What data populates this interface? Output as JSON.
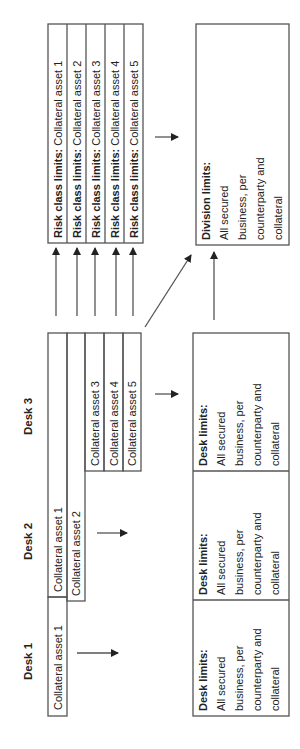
{
  "desks": [
    {
      "label": "Desk 1",
      "collateral": [
        "Collateral asset 1"
      ]
    },
    {
      "label": "Desk 2",
      "collateral": [
        "Collateral asset 1",
        "Collateral asset 2"
      ]
    },
    {
      "label": "Desk 3",
      "collateral": [
        "Collateral asset 3",
        "Collateral asset 4",
        "Collateral asset 5"
      ]
    }
  ],
  "risk_class_limits": [
    {
      "title": "Risk class limits:",
      "asset": "Collateral asset 1"
    },
    {
      "title": "Risk class limits:",
      "asset": "Collateral asset 2"
    },
    {
      "title": "Risk class limits:",
      "asset": "Collateral asset 3"
    },
    {
      "title": "Risk class limits:",
      "asset": "Collateral asset 4"
    },
    {
      "title": "Risk class limits:",
      "asset": "Collateral asset 5"
    }
  ],
  "desk_limits": [
    {
      "title": "Desk limits:",
      "lines": [
        "All secured",
        "business, per",
        "counterparty and",
        "collateral"
      ]
    },
    {
      "title": "Desk limits:",
      "lines": [
        "All secured",
        "business, per",
        "counterparty and",
        "collateral"
      ]
    },
    {
      "title": "Desk limits:",
      "lines": [
        "All secured",
        "business, per",
        "counterparty and",
        "collateral"
      ]
    }
  ],
  "division_limits": {
    "title": "Division limits:",
    "lines": [
      "All secured",
      "business, per",
      "counterparty and",
      "collateral"
    ]
  },
  "colors": {
    "stroke": "#555555",
    "text": "#222222",
    "background": "#ffffff"
  }
}
